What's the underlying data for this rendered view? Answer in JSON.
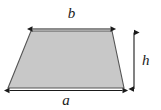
{
  "figure": {
    "type": "geometry-diagram",
    "shape_name": "trapezoid",
    "background_color": "#ffffff",
    "fill_color": "#c8c8c8",
    "stroke_color": "#4d4d4d",
    "arrow_color": "#1a1a1a",
    "labels": {
      "top_side": "b",
      "bottom_side": "a",
      "height": "h"
    },
    "dimensions": {
      "top_arrow": {
        "x1": 31,
        "x2": 112,
        "y": 29
      },
      "bottom_arrow": {
        "x1": 8,
        "x2": 124,
        "y": 90
      },
      "height_arrow": {
        "x": 134,
        "y1": 31,
        "y2": 90
      }
    },
    "shape_points": "31,31 112,31 124,88 8,88"
  }
}
